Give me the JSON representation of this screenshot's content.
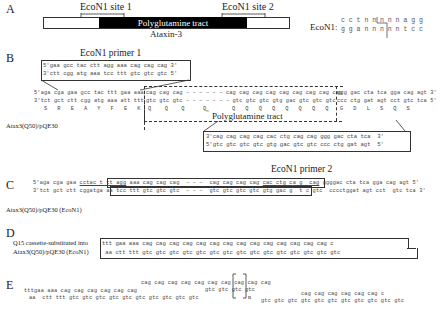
{
  "panels": {
    "A": "A",
    "B": "B",
    "C": "C",
    "D": "D",
    "E": "E"
  },
  "panel_a": {
    "site1_label": "EcoN1 site 1",
    "site2_label": "EcoN1 site 2",
    "tract_label": "Polyglutamine tract",
    "gene_label": "Ataxin-3",
    "enzyme_label": "EcoN1:",
    "enzyme_top": "c c t n n n n n a g g",
    "enzyme_bottom": "g g a n n n n n t c c"
  },
  "panel_b": {
    "primer1_label": "EcoN1 primer 1",
    "primer1_top": "5'gaa gcc tac ctt agg aaa cag cag cag 3'",
    "primer1_bottom": "3'ctt cgg atg aaa tcc ttt gtc gtc gtc 5'",
    "seq_top_left": "5'aga cga gaa gcc tac ttt gaa aaa",
    "seq_top_mid": "cag cag cag – – – – – – cag cag cag cag cag cag cag cag cag",
    "seq_top_right": "ggg gac cta tca gga cag agt 3'",
    "seq_bot_left": "3'tct gct ctt cgg atg aaa att ttt",
    "seq_bot_mid": "gtc gtc gtc – – – – – – – gtc gtc gtc gtg gac gtc gtc gtc",
    "seq_bot_right": "ccc ctg gat agt cct gtc tca 5'",
    "aa_left": "S   R   E   A   Y   F   E   K",
    "aa_mid": "Q    Q    Q",
    "aa_qn": "Q",
    "aa_qn_sub": "n",
    "aa_mid2": "Q   Q   Q   Q   Q   Q   Q   Q",
    "aa_right": "G   D   L   S   Q   S",
    "tract_label": "Polyglutamine tract",
    "construct_label": "Atax3(Q50)/pQE30",
    "primer2_top": "3'cag cag cag cag cac ctg cag cag ggg gac cta tca  3'",
    "primer2_bottom": "5'gtc gtc gtc gtc gtg gac gtc gtc ccc ctg gat agt  5'"
  },
  "panel_c": {
    "primer2_label": "EcoN1 primer 2",
    "top_left": "5'aga cga gaa ",
    "top_ul1": "cctac t tt agg",
    "top_mid": " aaa cag cag cag  – – –  cag cag cag cag ",
    "top_ul2": "cac ctg c",
    "top_ul3": "a g  cag",
    "top_right": " ggggac cta tca gga cag agt 5'",
    "bot_left": "3'tct gct ctt cggatg",
    "bot_mid": "a aa tcc ttt gtc gtc gtc  – – –  gtc gtc gtc gtc gtg gac g ",
    "bot_right": " t c gtc  cccctggat agt cct  gtc tca 3'",
    "construct_label": "Atax3(Q50)/pQE30 (EcoN1)"
  },
  "panel_d": {
    "label_line1": "Q15 cassette-substituted into",
    "label_line2": "Atax3(Q50)/pQE30 (EcoN1)",
    "top": "ttt gaa aaa cag cag cag cag cag cag cag cag cag cag cag cag cag cag c",
    "bottom": " aa ctt ttt gtc gtc gtc gtc gtc gtc gtc gtc gtc gtc gtc gtc gtc gtc gtc"
  },
  "panel_e": {
    "row1": "cag cag cag cag cag cag cag cag cag cag",
    "row1b": "gtc",
    "row2": "tttgaa aaa cag cag cag cag cag cag",
    "row2b": "gtc gtc gtc gtc",
    "row3": "aa  ctt ttt gtc gtc gtc gtc gtc gtc gtc gtc gtc gtc",
    "subscript": "n",
    "right_top": "cag cag cag cag cag cag c",
    "right_bot": "gtc gtc gtc gtc gtc gtc gtc gtc gtc gtc gtc"
  }
}
